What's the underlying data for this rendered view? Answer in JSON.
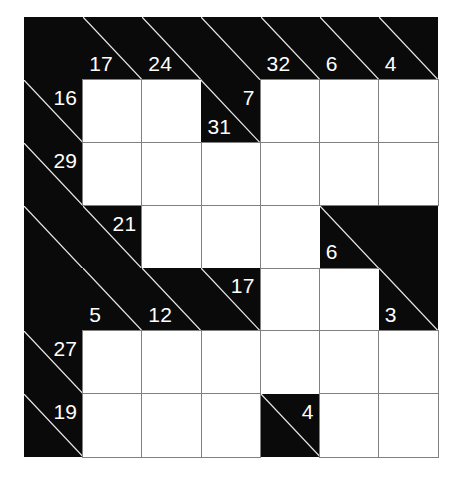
{
  "puzzle": {
    "type": "kakuro",
    "title": "Kakuro",
    "rows": 7,
    "cols": 7,
    "colors": {
      "block": "#0a0a0a",
      "entry": "#ffffff",
      "grid_line": "#808080",
      "clue_text": "#ffffff",
      "page_background": "#ffffff"
    },
    "grid": [
      [
        {
          "kind": "block"
        },
        {
          "kind": "clue",
          "down": "17",
          "diagonal": true
        },
        {
          "kind": "clue",
          "down": "24",
          "diagonal": true
        },
        {
          "kind": "clue",
          "diagonal": true
        },
        {
          "kind": "clue",
          "down": "32",
          "diagonal": true
        },
        {
          "kind": "clue",
          "down": "6",
          "diagonal": true
        },
        {
          "kind": "clue",
          "down": "4",
          "diagonal": true
        }
      ],
      [
        {
          "kind": "clue",
          "across": "16",
          "diagonal": true
        },
        {
          "kind": "entry"
        },
        {
          "kind": "entry"
        },
        {
          "kind": "clue",
          "down": "31",
          "across": "7",
          "diagonal": true
        },
        {
          "kind": "entry"
        },
        {
          "kind": "entry"
        },
        {
          "kind": "entry"
        }
      ],
      [
        {
          "kind": "clue",
          "across": "29",
          "diagonal": true
        },
        {
          "kind": "entry"
        },
        {
          "kind": "entry"
        },
        {
          "kind": "entry"
        },
        {
          "kind": "entry"
        },
        {
          "kind": "entry"
        },
        {
          "kind": "entry"
        }
      ],
      [
        {
          "kind": "clue",
          "diagonal": true
        },
        {
          "kind": "clue",
          "across": "21",
          "diagonal": true
        },
        {
          "kind": "entry"
        },
        {
          "kind": "entry"
        },
        {
          "kind": "entry"
        },
        {
          "kind": "clue",
          "down": "6",
          "diagonal": true
        },
        {
          "kind": "block"
        }
      ],
      [
        {
          "kind": "block"
        },
        {
          "kind": "clue",
          "down": "5",
          "diagonal": true
        },
        {
          "kind": "clue",
          "down": "12",
          "diagonal": true
        },
        {
          "kind": "clue",
          "across": "17",
          "diagonal": true
        },
        {
          "kind": "entry"
        },
        {
          "kind": "entry"
        },
        {
          "kind": "clue",
          "down": "3",
          "diagonal": true
        }
      ],
      [
        {
          "kind": "clue",
          "across": "27",
          "diagonal": true
        },
        {
          "kind": "entry"
        },
        {
          "kind": "entry"
        },
        {
          "kind": "entry"
        },
        {
          "kind": "entry"
        },
        {
          "kind": "entry"
        },
        {
          "kind": "entry"
        }
      ],
      [
        {
          "kind": "clue",
          "across": "19",
          "diagonal": true
        },
        {
          "kind": "entry"
        },
        {
          "kind": "entry"
        },
        {
          "kind": "entry"
        },
        {
          "kind": "clue",
          "across": "4",
          "diagonal": true
        },
        {
          "kind": "entry"
        },
        {
          "kind": "entry"
        }
      ]
    ],
    "clues_across": [
      {
        "row": 1,
        "col": 0,
        "value": "16"
      },
      {
        "row": 1,
        "col": 3,
        "value": "7"
      },
      {
        "row": 2,
        "col": 0,
        "value": "29"
      },
      {
        "row": 3,
        "col": 1,
        "value": "21"
      },
      {
        "row": 4,
        "col": 3,
        "value": "17"
      },
      {
        "row": 5,
        "col": 0,
        "value": "27"
      },
      {
        "row": 6,
        "col": 0,
        "value": "19"
      },
      {
        "row": 6,
        "col": 4,
        "value": "4"
      }
    ],
    "clues_down": [
      {
        "row": 0,
        "col": 1,
        "value": "17"
      },
      {
        "row": 0,
        "col": 2,
        "value": "24"
      },
      {
        "row": 0,
        "col": 4,
        "value": "32"
      },
      {
        "row": 0,
        "col": 5,
        "value": "6"
      },
      {
        "row": 0,
        "col": 6,
        "value": "4"
      },
      {
        "row": 1,
        "col": 3,
        "value": "31"
      },
      {
        "row": 3,
        "col": 5,
        "value": "6"
      },
      {
        "row": 4,
        "col": 1,
        "value": "5"
      },
      {
        "row": 4,
        "col": 2,
        "value": "12"
      },
      {
        "row": 4,
        "col": 6,
        "value": "3"
      }
    ]
  }
}
